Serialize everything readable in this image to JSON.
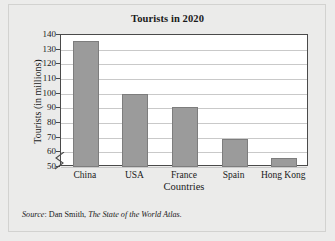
{
  "chart_data": {
    "type": "bar",
    "title": "Tourists in 2020",
    "xlabel": "Countries",
    "ylabel": "Tourists (in millions)",
    "categories": [
      "China",
      "USA",
      "France",
      "Spain",
      "Hong Kong"
    ],
    "values": [
      136,
      100,
      91,
      69,
      56
    ],
    "ylim": [
      50,
      140
    ],
    "yticks": [
      50,
      60,
      70,
      80,
      90,
      100,
      110,
      120,
      130,
      140
    ],
    "grid": true,
    "axis_break": true,
    "legend": "none",
    "bar_color": "#9b9b9b",
    "bar_border_color": "#7d7d7d",
    "gridline_color": "#c9c9c9",
    "axis_color": "#4a4a4a",
    "plot_background": "#ffffff",
    "figure_background": "#ebebea"
  },
  "source": {
    "prefix": "Source",
    "separator": ": ",
    "author": "Dan Smith, ",
    "work": "The State of the World Atlas."
  }
}
